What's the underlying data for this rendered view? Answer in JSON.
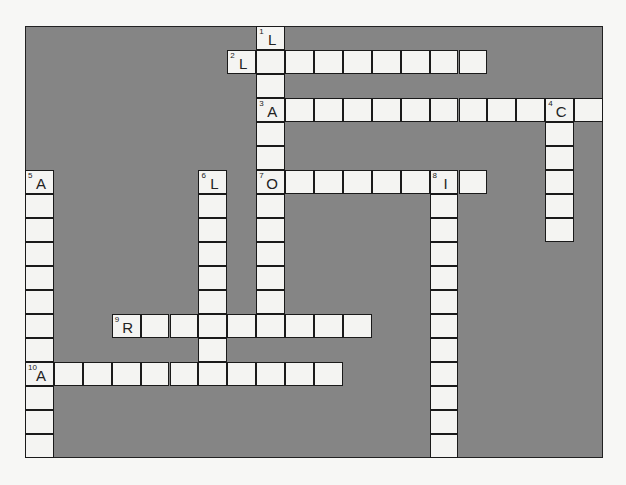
{
  "puzzle": {
    "type": "crossword",
    "grid": {
      "cols": 20,
      "rows": 18,
      "cell_w": 28.9,
      "cell_h": 24
    },
    "colors": {
      "block": "#858585",
      "cell": "#f4f4f2",
      "border": "#1a1a1a",
      "page": "#f7f7f5"
    },
    "words": [
      {
        "number": 1,
        "direction": "down",
        "row": 0,
        "col": 8,
        "length": 13,
        "first_letter": "L"
      },
      {
        "number": 2,
        "direction": "across",
        "row": 1,
        "col": 7,
        "length": 9,
        "first_letter": "L"
      },
      {
        "number": 3,
        "direction": "across",
        "row": 3,
        "col": 8,
        "length": 12,
        "first_letter": "A"
      },
      {
        "number": 4,
        "direction": "down",
        "row": 3,
        "col": 18,
        "length": 6,
        "first_letter": "C"
      },
      {
        "number": 5,
        "direction": "down",
        "row": 6,
        "col": 0,
        "length": 12,
        "first_letter": "A"
      },
      {
        "number": 6,
        "direction": "down",
        "row": 6,
        "col": 6,
        "length": 8,
        "first_letter": "L"
      },
      {
        "number": 7,
        "direction": "across",
        "row": 6,
        "col": 8,
        "length": 8,
        "first_letter": "O"
      },
      {
        "number": 8,
        "direction": "down",
        "row": 6,
        "col": 14,
        "length": 12,
        "first_letter": "I"
      },
      {
        "number": 9,
        "direction": "across",
        "row": 12,
        "col": 3,
        "length": 9,
        "first_letter": "R"
      },
      {
        "number": 10,
        "direction": "across",
        "row": 14,
        "col": 0,
        "length": 11,
        "first_letter": "A"
      }
    ]
  }
}
